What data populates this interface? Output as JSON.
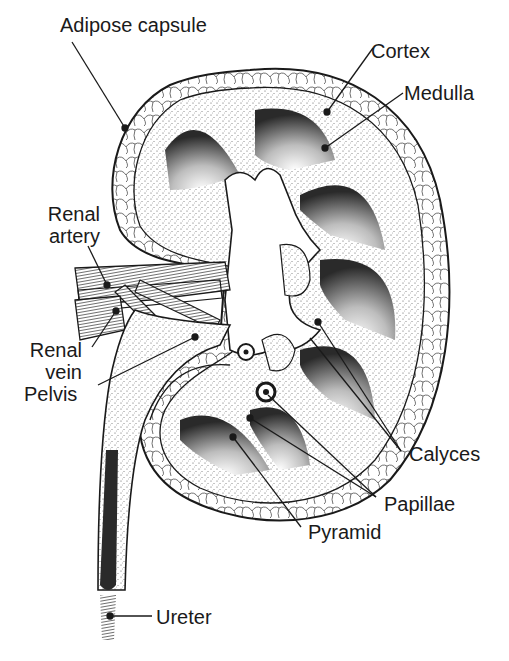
{
  "diagram": {
    "labels": {
      "adipose_capsule": "Adipose capsule",
      "cortex": "Cortex",
      "medulla": "Medulla",
      "renal_artery_1": "Renal",
      "renal_artery_2": "artery",
      "renal_vein_1": "Renal",
      "renal_vein_2": "vein",
      "pelvis": "Pelvis",
      "calyces": "Calyces",
      "papillae": "Papillae",
      "pyramid": "Pyramid",
      "ureter": "Ureter"
    },
    "colors": {
      "ink": "#1a1a1a",
      "background": "#ffffff",
      "stipple": "#8a8a8a"
    }
  }
}
